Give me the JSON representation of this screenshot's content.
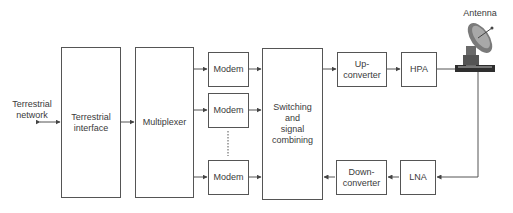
{
  "diagram": {
    "external_label": "Terrestrial\nnetwork",
    "antenna_label": "Antenna",
    "blocks": {
      "terrestrial_interface": "Terrestrial\ninterface",
      "multiplexer": "Multiplexer",
      "modem_1": "Modem",
      "modem_2": "Modem",
      "modem_n": "Modem",
      "switching": "Switching\nand\nsignal\ncombining",
      "up_converter": "Up-\nconverter",
      "hpa": "HPA",
      "down_converter": "Down-\nconverter",
      "lna": "LNA"
    },
    "colors": {
      "line": "#555555",
      "text": "#3a3a3a",
      "antenna": "#6a6a6a"
    }
  }
}
